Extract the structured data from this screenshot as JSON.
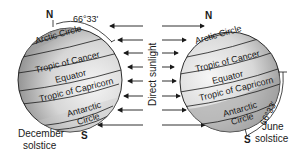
{
  "diagram": {
    "type": "solstice-earth-tilt",
    "colors": {
      "globe_light": "#f2f2f2",
      "globe_dark": "#9a9a9a",
      "line": "#1a1a1a",
      "background": "#ffffff"
    },
    "center_label": "Direct sunlight",
    "left_globe": {
      "caption_line1": "December",
      "caption_line2": "solstice",
      "north": "N",
      "south": "S",
      "angle": "66°33'",
      "lines": {
        "arctic": "Arctic Circle",
        "cancer": "Tropic of Cancer",
        "equator": "Equator",
        "capricorn": "Tropic of Capricorn",
        "antarctic_1": "Antarctic",
        "antarctic_2": "Circle"
      }
    },
    "right_globe": {
      "caption_line1": "June",
      "caption_line2": "solstice",
      "north": "N",
      "south": "S",
      "angle": "66°33'",
      "lines": {
        "arctic": "Arctic Circle",
        "cancer": "Tropic of Cancer",
        "equator": "Equator",
        "capricorn": "Tropic of Capricorn",
        "antarctic_1": "Antarctic",
        "antarctic_2": "Circle"
      }
    },
    "arrows": {
      "left_direction": "left",
      "right_direction": "right",
      "rows": 8
    }
  }
}
